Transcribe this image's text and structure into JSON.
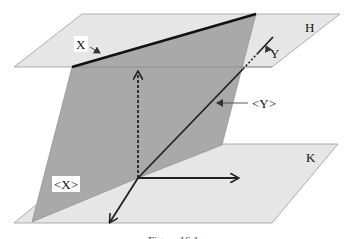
{
  "figure": {
    "planes": [
      {
        "name": "H",
        "label": "H",
        "fill": "#e6e6e6"
      },
      {
        "name": "K",
        "label": "K",
        "fill": "#e6e6e6"
      },
      {
        "name": "vertical",
        "fill": "#a9a9a9"
      }
    ],
    "labels": {
      "X": "X",
      "Y": "Y",
      "X_bracket": "<X>",
      "Y_bracket": "<Y>",
      "H": "H",
      "K": "K"
    },
    "caption": "Figure 16.1"
  }
}
